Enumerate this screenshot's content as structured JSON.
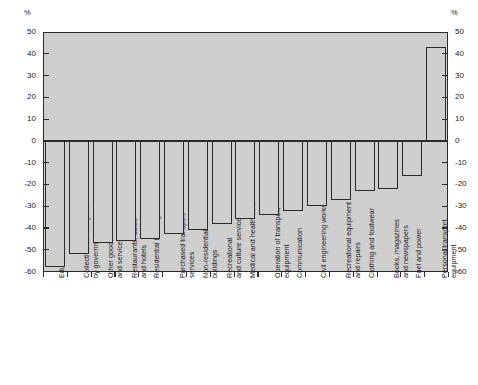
{
  "axis": {
    "unit_symbol": "%",
    "y_ticks": [
      50,
      40,
      30,
      20,
      10,
      0,
      -10,
      -20,
      -30,
      -40,
      -50,
      -60
    ],
    "y_tick_labels_left": [
      "50",
      "40",
      "30",
      "20",
      "10",
      "0",
      "-10",
      "-20",
      "-30",
      "-40",
      "-50",
      "-60"
    ],
    "y_tick_labels_right": [
      "50",
      "40",
      "30",
      "20",
      "10",
      "0",
      "-10",
      "-20",
      "-30",
      "-40",
      "-50",
      "-60"
    ]
  },
  "colors": {
    "plot_background": "#cfcfcf",
    "bar_fill": "#cfcfcf",
    "bar_stroke": "#2b2b2b",
    "page_background": "#ffffff",
    "text": "#1a1a1a"
  },
  "chart_data": {
    "type": "bar",
    "title": "",
    "subtitle": "",
    "xlabel": "",
    "ylabel": "%",
    "ylim": [
      -60,
      50
    ],
    "grid": false,
    "legend": false,
    "orientation": "vertical",
    "categories": [
      "Education",
      "Collective consumption\nby government",
      "Other goods\nand services",
      "Restaurants, cafes\nand hotels",
      "Residential buildings",
      "Purchased transport\nservices",
      "Non-residential\nbuildings",
      "Recreational\nand culture services",
      "Medical and health care",
      "Operation of transport\nequipment",
      "Communication",
      "Civil engineering works",
      "Recreational equipment\nand repairs",
      "Clothing and footwear",
      "Books, magazines\nand newspapers",
      "Fuel and power",
      "Personal transport\nequipment"
    ],
    "values": [
      -58,
      -52,
      -47,
      -46,
      -45,
      -43,
      -41,
      -38,
      -36,
      -34,
      -32,
      -30,
      -27,
      -23,
      -22,
      -16,
      43
    ]
  }
}
